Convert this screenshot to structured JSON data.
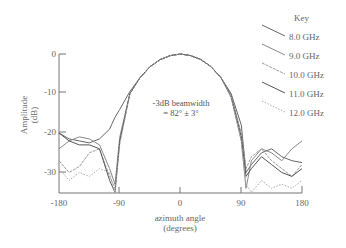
{
  "chart_data": {
    "type": "line",
    "title": "",
    "xlabel": "azimuth angle (degrees)",
    "ylabel": "Amplitude (dB)",
    "xlim": [
      -180,
      180
    ],
    "ylim": [
      -35,
      0
    ],
    "x_ticks": [
      -180,
      -90,
      0,
      90,
      180
    ],
    "y_ticks": [
      0,
      -10,
      -20,
      -30
    ],
    "grid": false,
    "legend_position": "upper right, outside plot",
    "legend_title": "Key",
    "annotation": "-3dB beamwidth = 82° ± 3°",
    "x": [
      -180,
      -165,
      -150,
      -135,
      -120,
      -105,
      -97,
      -90,
      -75,
      -60,
      -45,
      -30,
      -15,
      0,
      15,
      30,
      45,
      60,
      75,
      90,
      97,
      105,
      120,
      135,
      150,
      165,
      180
    ],
    "series": [
      {
        "name": "8.0 GHz",
        "values": [
          -20,
          -21.5,
          -22,
          -22.5,
          -21.5,
          -19,
          -16,
          -14,
          -9.5,
          -6,
          -3.2,
          -1.4,
          -0.4,
          0,
          -0.4,
          -1.4,
          -3.2,
          -6,
          -10,
          -18,
          -30,
          -28,
          -25,
          -24,
          -26,
          -27,
          -27.5
        ]
      },
      {
        "name": "9.0 GHz",
        "values": [
          -24,
          -22,
          -21,
          -21.5,
          -23,
          -29,
          -33,
          -21,
          -10,
          -6,
          -3.2,
          -1.4,
          -0.4,
          0,
          -0.4,
          -1.4,
          -3.2,
          -6,
          -11,
          -22,
          -34,
          -27,
          -24,
          -25,
          -27,
          -24,
          -22
        ]
      },
      {
        "name": "10.0 GHz",
        "values": [
          -27,
          -30,
          -28.5,
          -25,
          -24,
          -31,
          -34,
          -22,
          -10,
          -6,
          -3.2,
          -1.4,
          -0.4,
          0,
          -0.4,
          -1.4,
          -3.2,
          -6,
          -10.5,
          -20,
          -29,
          -26,
          -24,
          -27,
          -29,
          -31,
          -28
        ]
      },
      {
        "name": "11.0 GHz",
        "values": [
          -20,
          -22,
          -23,
          -23,
          -24,
          -32,
          -35,
          -22,
          -10,
          -6,
          -3.2,
          -1.4,
          -0.4,
          0,
          -0.4,
          -1.4,
          -3.2,
          -6,
          -10.5,
          -21,
          -31,
          -29,
          -26,
          -28,
          -30,
          -31,
          -29
        ]
      },
      {
        "name": "12.0 GHz",
        "values": [
          -29,
          -32,
          -30,
          -31,
          -29,
          -30,
          -35,
          -23,
          -10,
          -6,
          -3.2,
          -1.4,
          -0.4,
          0,
          -0.4,
          -1.4,
          -3.2,
          -6,
          -10.5,
          -22,
          -33,
          -35,
          -32,
          -34,
          -33,
          -34,
          -32
        ]
      }
    ]
  },
  "labels": {
    "y_axis_line1": "Amplitude",
    "y_axis_line2": "(dB)",
    "x_axis_line1": "azimuth angle",
    "x_axis_line2": "(degrees)",
    "annotation_line1": "-3dB beamwidth",
    "annotation_line2": "= 82° ± 3°",
    "legend_title": "Key",
    "y_tick_0": "0",
    "y_tick_10": "-10",
    "y_tick_20": "-20",
    "y_tick_30": "-30",
    "x_tick_m180": "-180",
    "x_tick_m90": "-90",
    "x_tick_0": "0",
    "x_tick_90": "90",
    "x_tick_180": "180",
    "legend_items": [
      "8.0 GHz",
      "9.0 GHz",
      "10.0 GHz",
      "11.0 GHz",
      "12.0 GHz"
    ]
  },
  "colors": {
    "axis": "#777777",
    "series": [
      "#666666",
      "#888888",
      "#999999",
      "#555555",
      "#aaaaaa"
    ]
  }
}
